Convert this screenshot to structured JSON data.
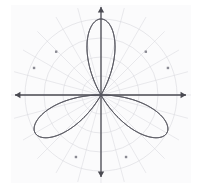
{
  "figure": {
    "title": "",
    "background_color": "#ffffff",
    "plot_panel_color": "#fbfbfc",
    "width": 198,
    "height": 183
  },
  "axes": {
    "origin": {
      "x": 101,
      "y": 95
    },
    "x_axis": {
      "label": "",
      "color": "#4a4a52",
      "left_tip_x": 15,
      "right_tip_x": 186,
      "arrow_left": true,
      "arrow_right": true
    },
    "y_axis": {
      "label": "",
      "color": "#4a4a52",
      "top_tip_y": 7,
      "bottom_tip_y": 177,
      "arrow_top": true,
      "arrow_bottom": true
    },
    "tick_labels_x": [],
    "tick_labels_y": []
  },
  "polar_grid": {
    "visible": true,
    "color": "#d8d8dd",
    "radial_line_color": "#dcdce1",
    "circle_radii": [
      19,
      38,
      57,
      76
    ],
    "angle_step_degrees": 15,
    "grid_on": true
  },
  "curve": {
    "color": "#55555e",
    "stroke_width": 1.0,
    "marker_color": "#8a8a93",
    "marker_shape": "square",
    "marker_size": 2.4,
    "petal_count": 3
  },
  "chart_data": {
    "type": "line",
    "title": "",
    "subtitle": "",
    "xlabel": "",
    "ylabel": "",
    "coordinate_system": "polar",
    "grid": true,
    "legend": "none",
    "xlim": [
      -1.15,
      1.15
    ],
    "ylim": [
      -1.15,
      1.15
    ],
    "equation": "r = cos(3θ)",
    "amplitude": 1.0,
    "petals": 3,
    "petal_tip_angles_degrees": [
      150,
      30,
      270
    ],
    "petal_tip_radius": 1.0,
    "series": [
      {
        "name": "r = cos(3θ)",
        "theta_degrees": [
          0,
          5,
          10,
          15,
          20,
          25,
          30,
          35,
          40,
          45,
          50,
          55,
          60,
          65,
          70,
          75,
          80,
          85,
          90,
          95,
          100,
          105,
          110,
          115,
          120,
          125,
          130,
          135,
          140,
          145,
          150,
          155,
          160,
          165,
          170,
          175,
          180,
          185,
          190,
          195,
          200,
          205,
          210,
          215,
          220,
          225,
          230,
          235,
          240,
          245,
          250,
          255,
          260,
          265,
          270,
          275,
          280,
          285,
          290,
          295,
          300,
          305,
          310,
          315,
          320,
          325,
          330,
          335,
          340,
          345,
          350,
          355,
          360
        ],
        "r_values": [
          0.0,
          0.259,
          0.5,
          0.707,
          0.866,
          0.966,
          1.0,
          0.966,
          0.866,
          0.707,
          0.5,
          0.259,
          0.0,
          -0.259,
          -0.5,
          -0.707,
          -0.866,
          -0.966,
          -1.0,
          -0.966,
          -0.866,
          -0.707,
          -0.5,
          -0.259,
          0.0,
          0.259,
          0.5,
          0.707,
          0.866,
          0.966,
          1.0,
          0.966,
          0.866,
          0.707,
          0.5,
          0.259,
          0.0,
          -0.259,
          -0.5,
          -0.707,
          -0.866,
          -0.966,
          -1.0,
          -0.966,
          -0.866,
          -0.707,
          -0.5,
          -0.259,
          0.0,
          0.259,
          0.5,
          0.707,
          0.866,
          0.966,
          1.0,
          0.966,
          0.866,
          0.707,
          0.5,
          0.259,
          0.0,
          -0.259,
          -0.5,
          -0.707,
          -0.866,
          -0.966,
          -1.0,
          -0.966,
          -0.866,
          -0.707,
          -0.5,
          -0.259,
          0.0
        ]
      }
    ],
    "markers": [
      {
        "theta_degrees": 22,
        "r": 0.95
      },
      {
        "theta_degrees": 44,
        "r": 0.82
      },
      {
        "theta_degrees": 136,
        "r": 0.82
      },
      {
        "theta_degrees": 158,
        "r": 0.95
      },
      {
        "theta_degrees": 248,
        "r": 0.88
      },
      {
        "theta_degrees": 292,
        "r": 0.88
      }
    ]
  }
}
